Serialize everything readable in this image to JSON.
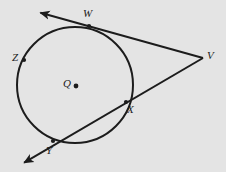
{
  "figure": {
    "kind": "geometry-diagram",
    "background_color": "#e4e4e4",
    "stroke_color": "#1c1c1c"
  },
  "circle": {
    "center_label": "Q",
    "center_x": 75,
    "center_y": 85,
    "radius": 58
  },
  "labels": {
    "center": "Q",
    "tangent_point": "W",
    "external_vertex": "V",
    "left_point": "Z",
    "secant_near": "X",
    "secant_far": "Y"
  },
  "points": [
    {
      "name": "Q",
      "label": "Q",
      "x": 75,
      "y": 85,
      "on_circle": false,
      "dot": true,
      "label_x": 63,
      "label_y": 78
    },
    {
      "name": "W",
      "label": "W",
      "x": 89,
      "y": 26,
      "on_circle": true,
      "dot": true,
      "label_x": 83,
      "label_y": 8
    },
    {
      "name": "Z",
      "label": "Z",
      "x": 24,
      "y": 60,
      "on_circle": true,
      "dot": true,
      "label_x": 12,
      "label_y": 52
    },
    {
      "name": "X",
      "label": "X",
      "x": 126,
      "y": 102,
      "on_circle": true,
      "dot": true,
      "label_x": 127,
      "label_y": 104
    },
    {
      "name": "Y",
      "label": "Y",
      "x": 53,
      "y": 141,
      "on_circle": true,
      "dot": true,
      "label_x": 46,
      "label_y": 145
    },
    {
      "name": "V",
      "label": "V",
      "x": 203,
      "y": 58,
      "on_circle": false,
      "dot": false,
      "label_x": 207,
      "label_y": 50
    }
  ],
  "lines": [
    {
      "name": "tangent-line-through-W",
      "type": "tangent",
      "from_label": "V",
      "through_label": "W",
      "x1": 203,
      "y1": 58,
      "x2": 38,
      "y2": 12,
      "arrow_start": false,
      "arrow_end": true
    },
    {
      "name": "secant-line-through-X-and-Y",
      "type": "secant",
      "from_label": "V",
      "through_label": "X, Y",
      "x1": 203,
      "y1": 58,
      "x2": 22,
      "y2": 164,
      "arrow_start": false,
      "arrow_end": true
    }
  ]
}
